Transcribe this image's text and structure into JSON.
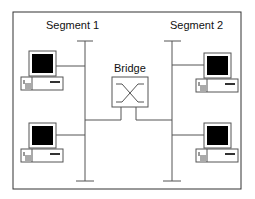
{
  "diagram": {
    "segments": [
      {
        "label": "Segment 1"
      },
      {
        "label": "Segment 2"
      }
    ],
    "bridge": {
      "label": "Bridge"
    },
    "computers": 4,
    "colors": {
      "line": "#555555",
      "frame": "#333333",
      "screen": "#000000"
    }
  }
}
